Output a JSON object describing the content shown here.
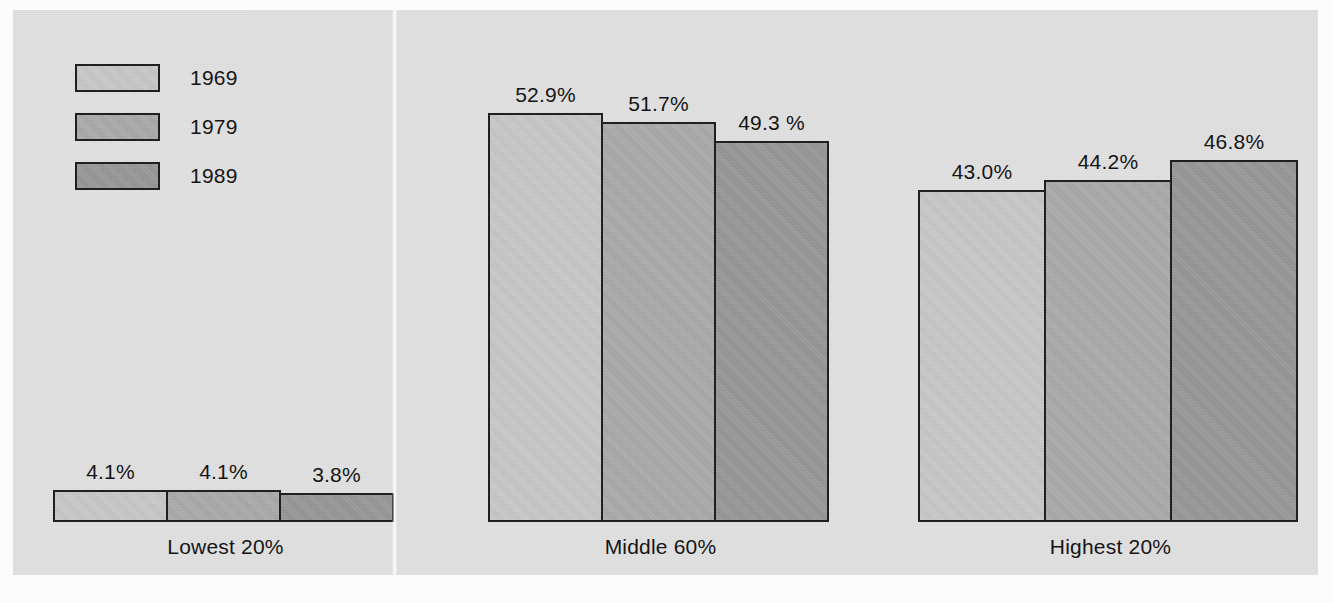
{
  "chart_data": {
    "type": "bar",
    "title": "",
    "subtitle": "",
    "xlabel": "",
    "ylabel": "",
    "ylim": [
      0,
      55
    ],
    "grid": false,
    "legend_position": "top-left",
    "categories": [
      "Lowest 20%",
      "Middle 60%",
      "Highest 20%"
    ],
    "series": [
      {
        "name": "1969",
        "color": "#c9c9c9",
        "values": [
          4.1,
          52.9,
          43.0
        ],
        "labels": [
          "4.1%",
          "52.9%",
          "43.0%"
        ]
      },
      {
        "name": "1979",
        "color": "#aaaaaa",
        "values": [
          4.1,
          51.7,
          44.2
        ],
        "labels": [
          "4.1%",
          "51.7%",
          "44.2%"
        ]
      },
      {
        "name": "1989",
        "color": "#969696",
        "values": [
          3.8,
          49.3,
          46.8
        ],
        "labels": [
          "3.8%",
          "49.3 %",
          "46.8%"
        ]
      }
    ],
    "value_unit": "%"
  },
  "legend": {
    "items": [
      {
        "label": "1969",
        "color": "#c9c9c9"
      },
      {
        "label": "1979",
        "color": "#aaaaaa"
      },
      {
        "label": "1989",
        "color": "#969696"
      }
    ]
  },
  "groups": [
    {
      "label": "Lowest 20%",
      "bars": [
        {
          "series": "1969",
          "label": "4.1%",
          "value": 4.1,
          "color": "#c9c9c9"
        },
        {
          "series": "1979",
          "label": "4.1%",
          "value": 4.1,
          "color": "#aaaaaa"
        },
        {
          "series": "1989",
          "label": "3.8%",
          "value": 3.8,
          "color": "#969696"
        }
      ]
    },
    {
      "label": "Middle 60%",
      "bars": [
        {
          "series": "1969",
          "label": "52.9%",
          "value": 52.9,
          "color": "#c9c9c9"
        },
        {
          "series": "1979",
          "label": "51.7%",
          "value": 51.7,
          "color": "#aaaaaa"
        },
        {
          "series": "1989",
          "label": "49.3 %",
          "value": 49.3,
          "color": "#969696"
        }
      ]
    },
    {
      "label": "Highest 20%",
      "bars": [
        {
          "series": "1969",
          "label": "43.0%",
          "value": 43.0,
          "color": "#c9c9c9"
        },
        {
          "series": "1979",
          "label": "44.2%",
          "value": 44.2,
          "color": "#aaaaaa"
        },
        {
          "series": "1989",
          "label": "46.8%",
          "value": 46.8,
          "color": "#969696"
        }
      ]
    }
  ],
  "style": {
    "panel_background": "#e2e2e2",
    "page_background": "#fcfcfc",
    "bar_outline": "#1d1d1d",
    "text_color": "#121212"
  }
}
